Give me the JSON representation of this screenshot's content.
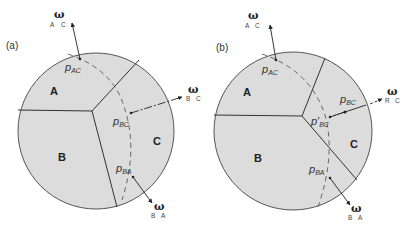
{
  "colors": {
    "grain_fill": "#dcdcdc",
    "stroke": "#333333",
    "dashed": "#555555",
    "background": "#ffffff"
  },
  "panels": [
    {
      "label": "(a)",
      "grains": [
        "A",
        "B",
        "C"
      ],
      "points": [
        {
          "symbol": "p",
          "sub": "AC"
        },
        {
          "symbol": "p",
          "sub": "BC"
        },
        {
          "symbol": "p",
          "sub": "BA"
        }
      ],
      "omegas": [
        {
          "symbol": "ω",
          "sub1": "A",
          "sub2": "C"
        },
        {
          "symbol": "ω",
          "sub1": "B",
          "sub2": "C"
        },
        {
          "symbol": "ω",
          "sub1": "B",
          "sub2": "A"
        }
      ]
    },
    {
      "label": "(b)",
      "grains": [
        "A",
        "B",
        "C"
      ],
      "points": [
        {
          "symbol": "p",
          "sub": "AC"
        },
        {
          "symbol": "p",
          "sub": "BC"
        },
        {
          "symbol": "p′",
          "sub": "BC"
        },
        {
          "symbol": "p",
          "sub": "BA"
        }
      ],
      "omegas": [
        {
          "symbol": "ω",
          "sub1": "A",
          "sub2": "C"
        },
        {
          "symbol": "ω",
          "sub1": "R",
          "sub2": "C"
        },
        {
          "symbol": "ω",
          "sub1": "B",
          "sub2": "A"
        }
      ]
    }
  ]
}
